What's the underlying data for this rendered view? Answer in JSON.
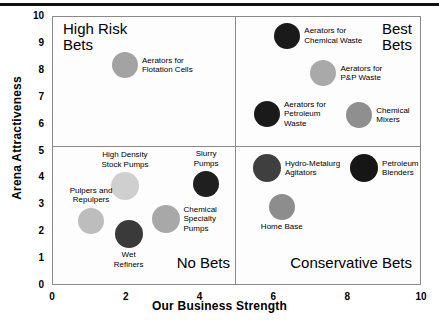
{
  "chart_data": {
    "type": "scatter",
    "title": "",
    "xlabel": "Our Business Strength",
    "ylabel": "Arena Attractiveness",
    "xlim": [
      0,
      10
    ],
    "ylim": [
      0,
      10
    ],
    "xticks": [
      "0",
      "2",
      "4",
      "6",
      "8",
      "10"
    ],
    "yticks": [
      "0",
      "1",
      "2",
      "3",
      "4",
      "5",
      "6",
      "7",
      "8",
      "9",
      "10"
    ],
    "grid": false,
    "legend": "none",
    "quadrant_divider_x": 4.93,
    "quadrant_divider_y": 5,
    "quadrants": [
      {
        "name": "high-risk-bets",
        "label": "High Risk\nBets",
        "position": "top-left"
      },
      {
        "name": "best-bets",
        "label": "Best\nBets",
        "position": "top-right"
      },
      {
        "name": "no-bets",
        "label": "No Bets",
        "position": "bottom-left"
      },
      {
        "name": "conservative-bets",
        "label": "Conservative Bets",
        "position": "bottom-right"
      }
    ],
    "points": [
      {
        "name": "aerators-for-flotation-cells",
        "label": "Aerators for\nFlotation Cells",
        "x": 1.95,
        "y": 8.2,
        "r": 13,
        "color": "#a3a3a3",
        "label_side": "right"
      },
      {
        "name": "aerators-for-chemical-waste",
        "label": "Aerators for\nChemical Waste",
        "x": 6.35,
        "y": 9.3,
        "r": 13,
        "color": "#1a1a1a",
        "label_side": "right"
      },
      {
        "name": "aerators-for-pp-waste",
        "label": "Aerators for\nP&P Waste",
        "x": 7.33,
        "y": 7.9,
        "r": 13,
        "color": "#a9a9a9",
        "label_side": "right"
      },
      {
        "name": "aerators-for-petroleum-waste",
        "label": "Aerators for\nPetroleum\nWaste",
        "x": 5.8,
        "y": 6.4,
        "r": 13,
        "color": "#1a1a1a",
        "label_side": "right"
      },
      {
        "name": "chemical-mixers",
        "label": "Chemical\nMixers",
        "x": 8.3,
        "y": 6.35,
        "r": 13,
        "color": "#8f8f8f",
        "label_side": "right"
      },
      {
        "name": "high-density-stock-pumps",
        "label": "High Density\nStock Pumps",
        "x": 1.95,
        "y": 3.7,
        "r": 14,
        "color": "#cfcfcf",
        "label_side": "top"
      },
      {
        "name": "slurry-pumps",
        "label": "Slurry\nPumps",
        "x": 4.15,
        "y": 3.78,
        "r": 13,
        "color": "#1f1f1f",
        "label_side": "top"
      },
      {
        "name": "pulpers-and-repulpers",
        "label": "Pulpers and\nRepulpers",
        "x": 1.03,
        "y": 2.42,
        "r": 13,
        "color": "#bdbdbd",
        "label_side": "top"
      },
      {
        "name": "wet-refiners",
        "label": "Wet\nRefiners",
        "x": 2.05,
        "y": 1.92,
        "r": 14,
        "color": "#3a3a3a",
        "label_side": "bottom"
      },
      {
        "name": "chemical-specialty-pumps",
        "label": "Chemical\nSpecialty\nPumps",
        "x": 3.05,
        "y": 2.5,
        "r": 14,
        "color": "#a8a8a8",
        "label_side": "right"
      },
      {
        "name": "hydro-metalurg-agitators",
        "label": "Hydro-Metalurg\nAgitators",
        "x": 5.8,
        "y": 4.38,
        "r": 14,
        "color": "#3f3f3f",
        "label_side": "right"
      },
      {
        "name": "petroleum-blenders",
        "label": "Petroleum\nBlenders",
        "x": 8.43,
        "y": 4.38,
        "r": 14,
        "color": "#161616",
        "label_side": "right"
      },
      {
        "name": "home-base",
        "label": "Home Base",
        "x": 6.2,
        "y": 2.95,
        "r": 13,
        "color": "#8d8d8d",
        "label_side": "bottom"
      }
    ]
  }
}
